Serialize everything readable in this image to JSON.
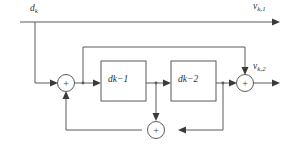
{
  "diagram": {
    "background_color": "#ffffff",
    "line_color": "#5b5b5b",
    "text_color": "#2e2e2e",
    "signals": {
      "input": {
        "base": "d",
        "sub": "k"
      },
      "output_top": {
        "base": "v",
        "sub": "k,1"
      },
      "output_bottom": {
        "base": "v",
        "sub": "k,2"
      }
    },
    "blocks": [
      {
        "id": "delay-1",
        "base": "d",
        "sub": "k−1"
      },
      {
        "id": "delay-2",
        "base": "d",
        "sub": "k−2"
      }
    ],
    "adders": [
      {
        "id": "adder-left",
        "operator": "+"
      },
      {
        "id": "adder-right",
        "operator": "+"
      },
      {
        "id": "adder-bottom",
        "operator": "+"
      }
    ]
  }
}
